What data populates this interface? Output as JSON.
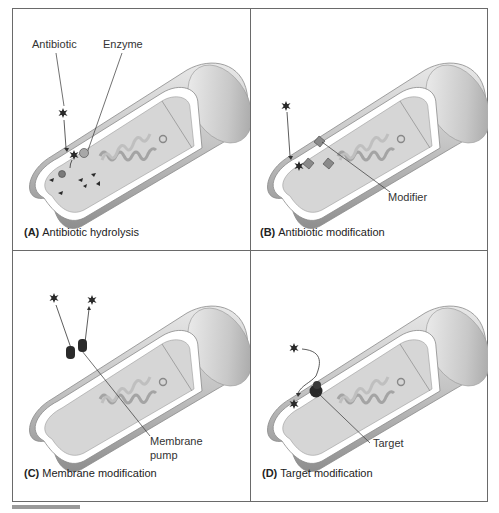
{
  "figure": {
    "panels": [
      {
        "letter": "(A)",
        "caption": "Antibiotic hydrolysis",
        "labels": {
          "antibiotic": "Antibiotic",
          "enzyme": "Enzyme"
        }
      },
      {
        "letter": "(B)",
        "caption": "Antibiotic modification",
        "labels": {
          "modifier": "Modifier"
        }
      },
      {
        "letter": "(C)",
        "caption": "Membrane modification",
        "labels": {
          "pump_line1": "Membrane",
          "pump_line2": "pump"
        }
      },
      {
        "letter": "(D)",
        "caption": "Target modification",
        "labels": {
          "target": "Target"
        }
      }
    ],
    "footer": {
      "caption_faded": "Antibiotic Resistance Mechanisms"
    },
    "colors": {
      "border": "#6a6a6a",
      "cell_outer": "#b8b8b8",
      "cell_inner": "#d9d9d9",
      "membrane": "#ffffff",
      "dark_glyph": "#2a2a2a"
    }
  }
}
